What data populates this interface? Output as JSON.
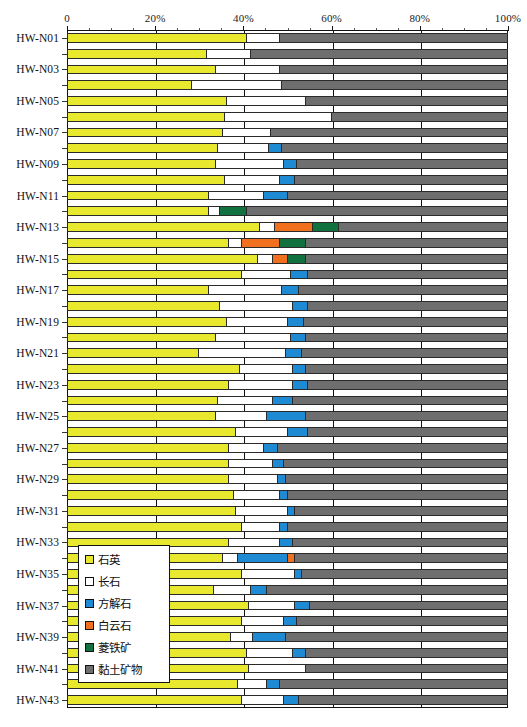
{
  "chart_data": {
    "type": "bar",
    "orientation": "horizontal",
    "stacked": true,
    "stack_mode": "percent",
    "title": "",
    "xlabel": "",
    "ylabel": "",
    "xlim": [
      0,
      100
    ],
    "grid": true,
    "legend_position": "inside-bottom-left",
    "xticks": [
      {
        "value": 0,
        "label": "0"
      },
      {
        "value": 20,
        "label": "20%"
      },
      {
        "value": 40,
        "label": "40%"
      },
      {
        "value": 60,
        "label": "60%"
      },
      {
        "value": 80,
        "label": "80%"
      },
      {
        "value": 100,
        "label": "100%"
      }
    ],
    "xminorticks": [
      5,
      10,
      15,
      25,
      30,
      35,
      45,
      50,
      55,
      65,
      70,
      75,
      85,
      90,
      95
    ],
    "series": [
      {
        "name": "石英",
        "key": "quartz",
        "color": "#e8e82e"
      },
      {
        "name": "长石",
        "key": "feldspar",
        "color": "#ffffff"
      },
      {
        "name": "方解石",
        "key": "calcite",
        "color": "#1f8ad4"
      },
      {
        "name": "白云石",
        "key": "dolomite",
        "color": "#f0701e"
      },
      {
        "name": "菱铁矿",
        "key": "siderite",
        "color": "#11713f"
      },
      {
        "name": "黏土矿物",
        "key": "clay",
        "color": "#6e6e6e"
      }
    ],
    "categories": [
      "HW-N01",
      "HW-N02",
      "HW-N03",
      "HW-N04",
      "HW-N05",
      "HW-N06",
      "HW-N07",
      "HW-N08",
      "HW-N09",
      "HW-N10",
      "HW-N11",
      "HW-N12",
      "HW-N13",
      "HW-N14",
      "HW-N15",
      "HW-N16",
      "HW-N17",
      "HW-N18",
      "HW-N19",
      "HW-N20",
      "HW-N21",
      "HW-N22",
      "HW-N23",
      "HW-N24",
      "HW-N25",
      "HW-N26",
      "HW-N27",
      "HW-N28",
      "HW-N29",
      "HW-N30",
      "HW-N31",
      "HW-N32",
      "HW-N33",
      "HW-N34",
      "HW-N35",
      "HW-N36",
      "HW-N37",
      "HW-N38",
      "HW-N39",
      "HW-N40",
      "HW-N41",
      "HW-N42",
      "HW-N43"
    ],
    "visible_category_labels": [
      "HW-N01",
      "",
      "HW-N03",
      "",
      "HW-N05",
      "",
      "HW-N07",
      "",
      "HW-N09",
      "",
      "HW-N11",
      "",
      "HW-N13",
      "",
      "HW-N15",
      "",
      "HW-N17",
      "",
      "HW-N19",
      "",
      "HW-N21",
      "",
      "HW-N23",
      "",
      "HW-N25",
      "",
      "HW-N27",
      "",
      "HW-N29",
      "",
      "HW-N31",
      "",
      "HW-N33",
      "",
      "HW-N35",
      "",
      "HW-N37",
      "",
      "HW-N39",
      "",
      "HW-N41",
      "",
      "HW-N43"
    ],
    "rows": [
      {
        "category": "HW-N01",
        "quartz": 40.5,
        "feldspar": 7.5,
        "calcite": 0,
        "dolomite": 0,
        "siderite": 0,
        "clay": 52.0
      },
      {
        "category": "HW-N02",
        "quartz": 31.5,
        "feldspar": 10.0,
        "calcite": 0,
        "dolomite": 0,
        "siderite": 0,
        "clay": 58.5
      },
      {
        "category": "HW-N03",
        "quartz": 33.5,
        "feldspar": 14.5,
        "calcite": 0,
        "dolomite": 0,
        "siderite": 0,
        "clay": 52.0
      },
      {
        "category": "HW-N04",
        "quartz": 28.0,
        "feldspar": 20.5,
        "calcite": 0,
        "dolomite": 0,
        "siderite": 0,
        "clay": 51.5
      },
      {
        "category": "HW-N05",
        "quartz": 36.0,
        "feldspar": 18.0,
        "calcite": 0,
        "dolomite": 0,
        "siderite": 0,
        "clay": 46.0
      },
      {
        "category": "HW-N06",
        "quartz": 35.5,
        "feldspar": 24.5,
        "calcite": 0,
        "dolomite": 0,
        "siderite": 0,
        "clay": 40.0
      },
      {
        "category": "HW-N07",
        "quartz": 35.0,
        "feldspar": 11.0,
        "calcite": 0,
        "dolomite": 0,
        "siderite": 0,
        "clay": 54.0
      },
      {
        "category": "HW-N08",
        "quartz": 34.0,
        "feldspar": 11.5,
        "calcite": 3.0,
        "dolomite": 0,
        "siderite": 0,
        "clay": 51.5
      },
      {
        "category": "HW-N09",
        "quartz": 33.5,
        "feldspar": 15.5,
        "calcite": 3.0,
        "dolomite": 0,
        "siderite": 0,
        "clay": 48.0
      },
      {
        "category": "HW-N10",
        "quartz": 35.5,
        "feldspar": 12.5,
        "calcite": 3.5,
        "dolomite": 0,
        "siderite": 0,
        "clay": 48.5
      },
      {
        "category": "HW-N11",
        "quartz": 32.0,
        "feldspar": 12.5,
        "calcite": 5.5,
        "dolomite": 0,
        "siderite": 0,
        "clay": 50.0
      },
      {
        "category": "HW-N12",
        "quartz": 32.0,
        "feldspar": 2.5,
        "calcite": 0,
        "dolomite": 0,
        "siderite": 6.0,
        "clay": 59.5
      },
      {
        "category": "HW-N13",
        "quartz": 43.5,
        "feldspar": 3.5,
        "calcite": 0,
        "dolomite": 8.5,
        "siderite": 6.0,
        "clay": 38.5
      },
      {
        "category": "HW-N14",
        "quartz": 36.5,
        "feldspar": 3.0,
        "calcite": 0,
        "dolomite": 8.5,
        "siderite": 6.0,
        "clay": 46.0
      },
      {
        "category": "HW-N15",
        "quartz": 43.0,
        "feldspar": 3.5,
        "calcite": 0,
        "dolomite": 3.5,
        "siderite": 4.0,
        "clay": 46.0
      },
      {
        "category": "HW-N16",
        "quartz": 39.5,
        "feldspar": 11.0,
        "calcite": 4.0,
        "dolomite": 0,
        "siderite": 0,
        "clay": 45.5
      },
      {
        "category": "HW-N17",
        "quartz": 32.0,
        "feldspar": 16.5,
        "calcite": 4.0,
        "dolomite": 0,
        "siderite": 0,
        "clay": 47.5
      },
      {
        "category": "HW-N18",
        "quartz": 34.5,
        "feldspar": 16.5,
        "calcite": 3.5,
        "dolomite": 0,
        "siderite": 0,
        "clay": 45.5
      },
      {
        "category": "HW-N19",
        "quartz": 36.0,
        "feldspar": 14.0,
        "calcite": 3.5,
        "dolomite": 0,
        "siderite": 0,
        "clay": 46.5
      },
      {
        "category": "HW-N20",
        "quartz": 33.5,
        "feldspar": 17.0,
        "calcite": 3.5,
        "dolomite": 0,
        "siderite": 0,
        "clay": 46.0
      },
      {
        "category": "HW-N21",
        "quartz": 29.5,
        "feldspar": 20.0,
        "calcite": 3.5,
        "dolomite": 0,
        "siderite": 0,
        "clay": 47.0
      },
      {
        "category": "HW-N22",
        "quartz": 39.0,
        "feldspar": 12.0,
        "calcite": 3.0,
        "dolomite": 0,
        "siderite": 0,
        "clay": 46.0
      },
      {
        "category": "HW-N23",
        "quartz": 36.5,
        "feldspar": 14.5,
        "calcite": 3.5,
        "dolomite": 0,
        "siderite": 0,
        "clay": 45.5
      },
      {
        "category": "HW-N24",
        "quartz": 34.0,
        "feldspar": 12.5,
        "calcite": 4.5,
        "dolomite": 0,
        "siderite": 0,
        "clay": 49.0
      },
      {
        "category": "HW-N25",
        "quartz": 33.5,
        "feldspar": 11.5,
        "calcite": 9.0,
        "dolomite": 0,
        "siderite": 0,
        "clay": 46.0
      },
      {
        "category": "HW-N26",
        "quartz": 38.0,
        "feldspar": 12.0,
        "calcite": 4.5,
        "dolomite": 0,
        "siderite": 0,
        "clay": 45.5
      },
      {
        "category": "HW-N27",
        "quartz": 36.5,
        "feldspar": 8.0,
        "calcite": 3.0,
        "dolomite": 0,
        "siderite": 0,
        "clay": 52.5
      },
      {
        "category": "HW-N28",
        "quartz": 36.5,
        "feldspar": 10.0,
        "calcite": 2.5,
        "dolomite": 0,
        "siderite": 0,
        "clay": 51.0
      },
      {
        "category": "HW-N29",
        "quartz": 36.5,
        "feldspar": 11.0,
        "calcite": 2.0,
        "dolomite": 0,
        "siderite": 0,
        "clay": 50.5
      },
      {
        "category": "HW-N30",
        "quartz": 37.5,
        "feldspar": 10.5,
        "calcite": 2.0,
        "dolomite": 0,
        "siderite": 0,
        "clay": 50.0
      },
      {
        "category": "HW-N31",
        "quartz": 38.0,
        "feldspar": 12.0,
        "calcite": 1.5,
        "dolomite": 0,
        "siderite": 0,
        "clay": 48.5
      },
      {
        "category": "HW-N32",
        "quartz": 39.5,
        "feldspar": 8.5,
        "calcite": 2.0,
        "dolomite": 0,
        "siderite": 0,
        "clay": 50.0
      },
      {
        "category": "HW-N33",
        "quartz": 36.5,
        "feldspar": 11.5,
        "calcite": 3.0,
        "dolomite": 0,
        "siderite": 0,
        "clay": 49.0
      },
      {
        "category": "HW-N34",
        "quartz": 35.0,
        "feldspar": 3.5,
        "calcite": 11.5,
        "dolomite": 1.5,
        "siderite": 0,
        "clay": 48.5
      },
      {
        "category": "HW-N35",
        "quartz": 39.5,
        "feldspar": 12.0,
        "calcite": 1.5,
        "dolomite": 0,
        "siderite": 0,
        "clay": 47.0
      },
      {
        "category": "HW-N36",
        "quartz": 33.0,
        "feldspar": 8.5,
        "calcite": 3.5,
        "dolomite": 0,
        "siderite": 0,
        "clay": 55.0
      },
      {
        "category": "HW-N37",
        "quartz": 41.0,
        "feldspar": 10.5,
        "calcite": 3.5,
        "dolomite": 0,
        "siderite": 0,
        "clay": 45.0
      },
      {
        "category": "HW-N38",
        "quartz": 39.5,
        "feldspar": 9.5,
        "calcite": 3.0,
        "dolomite": 0,
        "siderite": 0,
        "clay": 48.0
      },
      {
        "category": "HW-N39",
        "quartz": 37.0,
        "feldspar": 5.0,
        "calcite": 7.5,
        "dolomite": 0,
        "siderite": 0,
        "clay": 50.5
      },
      {
        "category": "HW-N40",
        "quartz": 40.5,
        "feldspar": 10.5,
        "calcite": 3.0,
        "dolomite": 0,
        "siderite": 0,
        "clay": 46.0
      },
      {
        "category": "HW-N41",
        "quartz": 41.0,
        "feldspar": 13.0,
        "calcite": 0,
        "dolomite": 0,
        "siderite": 0,
        "clay": 46.0
      },
      {
        "category": "HW-N42",
        "quartz": 38.5,
        "feldspar": 6.5,
        "calcite": 3.0,
        "dolomite": 0,
        "siderite": 0,
        "clay": 52.0
      },
      {
        "category": "HW-N43",
        "quartz": 39.5,
        "feldspar": 9.5,
        "calcite": 3.5,
        "dolomite": 0,
        "siderite": 0,
        "clay": 47.5
      }
    ]
  },
  "legend": {
    "items": [
      {
        "label": "石英",
        "color": "#e8e82e"
      },
      {
        "label": "长石",
        "color": "#ffffff"
      },
      {
        "label": "方解石",
        "color": "#1f8ad4"
      },
      {
        "label": "白云石",
        "color": "#f0701e"
      },
      {
        "label": "菱铁矿",
        "color": "#11713f"
      },
      {
        "label": "黏土矿物",
        "color": "#6e6e6e"
      }
    ]
  }
}
